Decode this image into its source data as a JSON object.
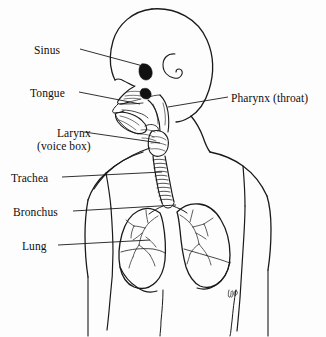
{
  "figure": {
    "type": "anatomical-line-drawing",
    "background_color": "#fdfdfd",
    "ink_color": "#1a1a1a",
    "width": 326,
    "height": 337
  },
  "labels": {
    "sinus": "Sinus",
    "tongue": "Tongue",
    "larynx": "Larynx",
    "larynx_sub": "(voice box)",
    "trachea": "Trachea",
    "bronchus": "Bronchus",
    "lung": "Lung",
    "pharynx": "Pharynx (throat)"
  },
  "leader_lines": [
    {
      "name": "sinus-leader",
      "from": [
        80,
        49
      ],
      "to": [
        143,
        66
      ]
    },
    {
      "name": "tongue-leader",
      "from": [
        79,
        92
      ],
      "to": [
        140,
        104
      ]
    },
    {
      "name": "larynx-leader",
      "from": [
        84,
        132
      ],
      "to": [
        160,
        143
      ]
    },
    {
      "name": "trachea-leader",
      "from": [
        62,
        177
      ],
      "to": [
        162,
        172
      ]
    },
    {
      "name": "bronchus-leader",
      "from": [
        73,
        211
      ],
      "to": [
        176,
        205
      ]
    },
    {
      "name": "lung-leader",
      "from": [
        58,
        245
      ],
      "to": [
        150,
        240
      ]
    },
    {
      "name": "pharynx-leader",
      "from": [
        228,
        97
      ],
      "to": [
        168,
        107
      ]
    }
  ],
  "parts": [
    "skull and head profile",
    "ear",
    "nasal cavity",
    "sinus cavity",
    "tongue",
    "pharynx",
    "larynx",
    "trachea with cartilage rings",
    "left bronchus",
    "right bronchus",
    "left lung",
    "right lung",
    "shoulders and arms outline",
    "torso outline"
  ],
  "signature": "artist initials"
}
